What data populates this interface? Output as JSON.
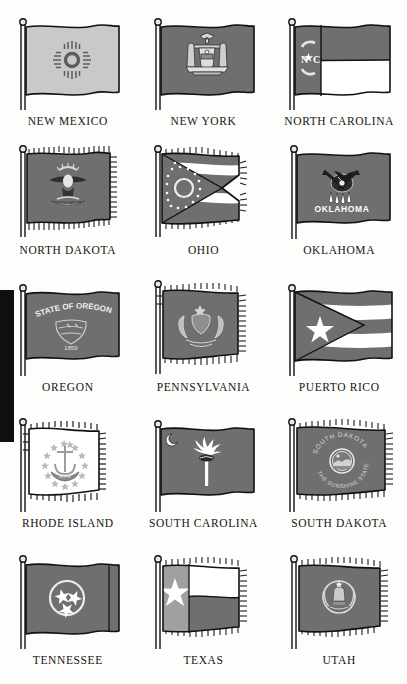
{
  "page": {
    "background_color": "#fdfdfb",
    "caption_color": "#141414",
    "columns": 3,
    "rows": 5
  },
  "artifacts": [
    {
      "name": "left-edge-scan-bar",
      "color": "#100f0d",
      "top": 290,
      "height": 152
    }
  ],
  "palette": {
    "field_dark": "#6f6f6f",
    "field_light": "#c9c9c9",
    "white": "#ffffff",
    "outline": "#111111",
    "pole": "#e8e8e4",
    "pole_line": "#1a1a1a",
    "emblem_dark": "#2b2b2b",
    "emblem_light": "#dcdcdc"
  },
  "flags": [
    {
      "index": 0,
      "caption": "NEW MEXICO",
      "field": "light",
      "fringe": false,
      "emblem": "zia-sun-symbol",
      "emblem_text": "",
      "notes": "Light gray field with dark gray Zia sun symbol centered"
    },
    {
      "index": 1,
      "caption": "NEW YORK",
      "field": "dark",
      "fringe": false,
      "emblem": "state-coat-of-arms",
      "emblem_text": "EXCELSIOR",
      "notes": "Dark blue (gray) field with coat of arms: eagle, shield, two supporters"
    },
    {
      "index": 2,
      "caption": "NORTH CAROLINA",
      "field": "dark",
      "fringe": false,
      "emblem": "nc-hoist-panel",
      "emblem_text": "N ★ C",
      "notes": "Dark hoist panel with N star C, dark red top band, white bottom band"
    },
    {
      "index": 3,
      "caption": "NORTH DAKOTA",
      "field": "dark",
      "fringe": true,
      "emblem": "bald-eagle-emblem",
      "emblem_text": "NORTH DAKOTA",
      "notes": "Fringed dark blue field with bald eagle, sunburst and scroll"
    },
    {
      "index": 4,
      "caption": "OHIO",
      "field": "dark",
      "fringe": true,
      "emblem": "ohio-burgee-circle-and-stars",
      "emblem_text": "",
      "notes": "Swallowtail burgee: blue triangle with white circle and 17 stars, red and white stripes"
    },
    {
      "index": 5,
      "caption": "OKLAHOMA",
      "field": "dark",
      "fringe": false,
      "emblem": "osage-shield-with-peace-pipe",
      "emblem_text": "OKLAHOMA",
      "notes": "Buffalo-skin shield with olive branch and calumet, OKLAHOMA below"
    },
    {
      "index": 6,
      "caption": "OREGON",
      "field": "dark",
      "fringe": false,
      "emblem": "state-escutcheon",
      "emblem_text": "STATE OF OREGON",
      "emblem_text_2": "1859",
      "notes": "Navy field, STATE OF OREGON arc above shield, date 1859 below"
    },
    {
      "index": 7,
      "caption": "PENNSYLVANIA",
      "field": "dark",
      "fringe": true,
      "emblem": "state-coat-of-arms",
      "emblem_text": "",
      "notes": "Fringed blue field with coat of arms, two horses, eagle crest"
    },
    {
      "index": 8,
      "caption": "PUERTO RICO",
      "field": "dark",
      "fringe": false,
      "emblem": "hoist-triangle-with-star",
      "emblem_text": "",
      "notes": "Five horizontal stripes with dark hoist triangle containing single white star"
    },
    {
      "index": 9,
      "caption": "RHODE ISLAND",
      "field": "white",
      "fringe": true,
      "emblem": "anchor-with-thirteen-stars",
      "emblem_text": "HOPE",
      "notes": "White fringed field, gold anchor, 13 stars in circle, HOPE ribbon"
    },
    {
      "index": 10,
      "caption": "SOUTH CAROLINA",
      "field": "dark",
      "fringe": false,
      "emblem": "palmetto-tree-and-crescent",
      "emblem_text": "",
      "notes": "Indigo field, white crescent at canton, white palmetto tree center"
    },
    {
      "index": 11,
      "caption": "SOUTH DAKOTA",
      "field": "dark",
      "fringe": true,
      "emblem": "state-seal-sunburst",
      "emblem_text": "SOUTH DAKOTA",
      "emblem_text_2": "THE SUNSHINE STATE",
      "notes": "Fringed field, seal encircled by SOUTH DAKOTA above and THE SUNSHINE STATE below"
    },
    {
      "index": 12,
      "caption": "TENNESSEE",
      "field": "dark",
      "fringe": false,
      "emblem": "three-stars-in-circle",
      "emblem_text": "",
      "notes": "Red field, white circle with three stars, vertical bar at fly"
    },
    {
      "index": 13,
      "caption": "TEXAS",
      "field": "dark",
      "fringe": true,
      "emblem": "lone-star",
      "emblem_text": "",
      "notes": "Blue hoist band with white lone star, white upper stripe, red lower stripe"
    },
    {
      "index": 14,
      "caption": "UTAH",
      "field": "dark",
      "fringe": true,
      "emblem": "state-seal-beehive",
      "emblem_text": "",
      "notes": "Fringed blue field with circular state seal: beehive, eagle, flags"
    }
  ]
}
